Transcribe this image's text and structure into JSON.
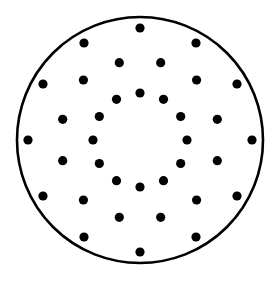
{
  "canvas": {
    "width": 277,
    "height": 282,
    "background_color": "#ffffff"
  },
  "figure": {
    "type": "dot-pattern-diagram"
  },
  "boundary_circle": {
    "name": "outer-circle",
    "center_x": 140,
    "center_y": 140,
    "radius": 123,
    "stroke_color": "#000000",
    "stroke_width": 2.6,
    "fill": "none"
  },
  "dot_style": {
    "radius": 4.6,
    "fill_color": "#000000",
    "count_total": 36
  },
  "rings": [
    {
      "name": "outer-ring",
      "dot_count": 12,
      "radius": 112,
      "start_angle_deg": -90,
      "angle_step_deg": 30
    },
    {
      "name": "middle-ring",
      "dot_count": 12,
      "radius": 80,
      "start_angle_deg": -75,
      "angle_step_deg": 30
    },
    {
      "name": "inner-ring",
      "dot_count": 12,
      "radius": 47,
      "start_angle_deg": -90,
      "angle_step_deg": 30
    }
  ],
  "chart_data": {
    "type": "scatter",
    "xlabel": "",
    "ylabel": "",
    "xlim": [
      0,
      277
    ],
    "ylim": [
      0,
      282
    ],
    "grid": false,
    "legend": "none",
    "series": [
      {
        "name": "outer-ring",
        "marker": "circle",
        "color": "#000000",
        "marker_radius": 4.6,
        "points": [
          {
            "x": 140.0,
            "y": 28.0
          },
          {
            "x": 196.0,
            "y": 43.0
          },
          {
            "x": 237.0,
            "y": 84.0
          },
          {
            "x": 252.0,
            "y": 140.0
          },
          {
            "x": 237.0,
            "y": 196.0
          },
          {
            "x": 196.0,
            "y": 237.0
          },
          {
            "x": 140.0,
            "y": 252.0
          },
          {
            "x": 84.0,
            "y": 237.0
          },
          {
            "x": 43.0,
            "y": 196.0
          },
          {
            "x": 28.0,
            "y": 140.0
          },
          {
            "x": 43.0,
            "y": 84.0
          },
          {
            "x": 84.0,
            "y": 43.0
          }
        ]
      },
      {
        "name": "middle-ring",
        "marker": "circle",
        "color": "#000000",
        "marker_radius": 4.6,
        "points": [
          {
            "x": 160.7,
            "y": 62.7
          },
          {
            "x": 196.6,
            "y": 80.0
          },
          {
            "x": 217.3,
            "y": 119.3
          },
          {
            "x": 217.3,
            "y": 160.7
          },
          {
            "x": 196.6,
            "y": 200.0
          },
          {
            "x": 160.7,
            "y": 217.3
          },
          {
            "x": 119.3,
            "y": 217.3
          },
          {
            "x": 83.4,
            "y": 200.0
          },
          {
            "x": 62.7,
            "y": 160.7
          },
          {
            "x": 62.7,
            "y": 119.3
          },
          {
            "x": 83.4,
            "y": 80.0
          },
          {
            "x": 119.3,
            "y": 62.7
          }
        ]
      },
      {
        "name": "inner-ring",
        "marker": "circle",
        "color": "#000000",
        "marker_radius": 4.6,
        "points": [
          {
            "x": 140.0,
            "y": 93.0
          },
          {
            "x": 163.5,
            "y": 99.3
          },
          {
            "x": 180.7,
            "y": 116.5
          },
          {
            "x": 187.0,
            "y": 140.0
          },
          {
            "x": 180.7,
            "y": 163.5
          },
          {
            "x": 163.5,
            "y": 180.7
          },
          {
            "x": 140.0,
            "y": 187.0
          },
          {
            "x": 116.5,
            "y": 180.7
          },
          {
            "x": 99.3,
            "y": 163.5
          },
          {
            "x": 93.0,
            "y": 140.0
          },
          {
            "x": 99.3,
            "y": 116.5
          },
          {
            "x": 116.5,
            "y": 99.3
          }
        ]
      }
    ]
  }
}
